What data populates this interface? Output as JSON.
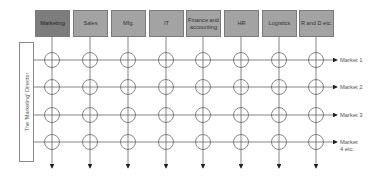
{
  "diagram": {
    "departments": [
      {
        "label": "Marketing",
        "x": 35,
        "active": true
      },
      {
        "label": "Sales",
        "x": 73
      },
      {
        "label": "Mfg.",
        "x": 111
      },
      {
        "label": "IT",
        "x": 149
      },
      {
        "label": "Finance and accounting",
        "x": 186
      },
      {
        "label": "HR",
        "x": 224
      },
      {
        "label": "Logistics",
        "x": 262
      },
      {
        "label": "R and D etc.",
        "x": 299
      }
    ],
    "director_label": "The 'Marketing' Director",
    "markets": [
      {
        "label": "Market 1",
        "y": 60
      },
      {
        "label": "Market 2",
        "y": 87
      },
      {
        "label": "Market 3",
        "y": 115
      },
      {
        "label": "Market 4 etc.",
        "y": 142
      }
    ],
    "colors": {
      "box_active": "#7d7d7d",
      "box": "#a3a3a3",
      "line": "#555555"
    }
  }
}
